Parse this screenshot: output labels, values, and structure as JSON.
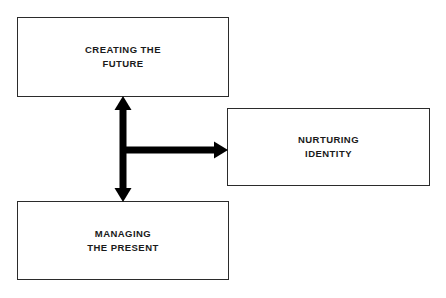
{
  "diagram": {
    "background_color": "#FFFFFF",
    "box_border_color": "#2B2B2B",
    "arrow_color": "#000000",
    "text_color": "#1A1A1A",
    "nodes": [
      {
        "id": "creating-future",
        "label": "CREATING THE\nFUTURE",
        "line1": "CREATING THE",
        "line2": "FUTURE",
        "position": "top-left"
      },
      {
        "id": "managing-present",
        "label": "MANAGING\nTHE PRESENT",
        "line1": "MANAGING",
        "line2": "THE PRESENT",
        "position": "bottom-left"
      },
      {
        "id": "nurturing-identity",
        "label": "NURTURING\nIDENTITY",
        "line1": "NURTURING",
        "line2": "IDENTITY",
        "position": "right-middle"
      }
    ],
    "connectors": [
      {
        "id": "vertical-double-arrow",
        "from": "creating-future",
        "to": "managing-present",
        "direction": "bidirectional",
        "orientation": "vertical"
      },
      {
        "id": "horizontal-arrow",
        "from": "vertical-double-arrow",
        "to": "nurturing-identity",
        "direction": "unidirectional",
        "orientation": "horizontal"
      }
    ]
  }
}
